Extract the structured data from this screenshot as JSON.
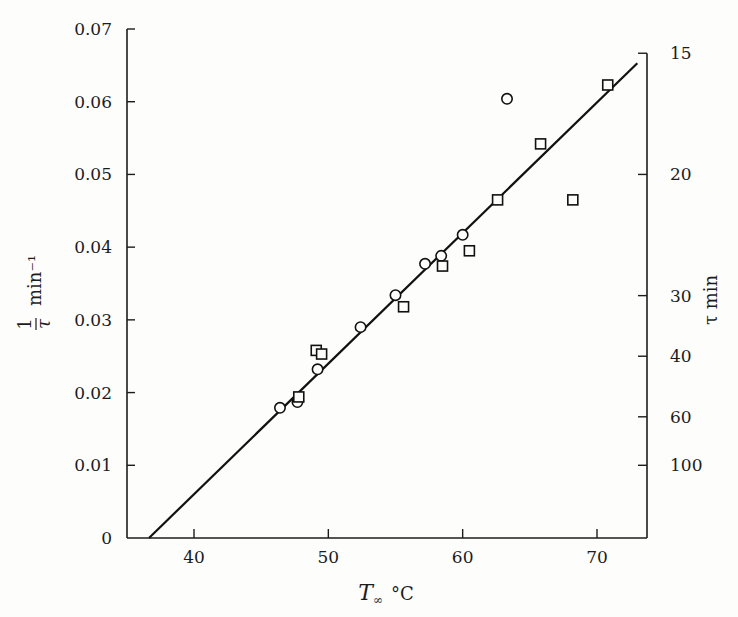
{
  "chart_data": {
    "type": "scatter",
    "title": "",
    "xlabel": "T∞ °C",
    "xlabel_main": "T",
    "xlabel_sub": "∞",
    "xlabel_unit": "°C",
    "ylabel": "1/τ min⁻¹",
    "ylabel_num": "1",
    "ylabel_den": "τ",
    "ylabel_unit": "min⁻¹",
    "y2label": "τ min",
    "xlim": [
      35.3,
      73.7
    ],
    "ylim": [
      0,
      0.07
    ],
    "grid": false,
    "legend": "none",
    "x_ticks": [
      {
        "value": 40,
        "label": "40"
      },
      {
        "value": 50,
        "label": "50"
      },
      {
        "value": 60,
        "label": "60"
      },
      {
        "value": 70,
        "label": "70"
      }
    ],
    "y_ticks": [
      {
        "value": 0,
        "label": "0"
      },
      {
        "value": 0.01,
        "label": "0.01"
      },
      {
        "value": 0.02,
        "label": "0.02"
      },
      {
        "value": 0.03,
        "label": "0.03"
      },
      {
        "value": 0.04,
        "label": "0.04"
      },
      {
        "value": 0.05,
        "label": "0.05"
      },
      {
        "value": 0.06,
        "label": "0.06"
      },
      {
        "value": 0.07,
        "label": "0.07"
      }
    ],
    "y2_ticks": [
      {
        "tau": 15,
        "label": "15"
      },
      {
        "tau": 20,
        "label": "20"
      },
      {
        "tau": 30,
        "label": "30"
      },
      {
        "tau": 40,
        "label": "40"
      },
      {
        "tau": 60,
        "label": "60"
      },
      {
        "tau": 100,
        "label": "100"
      }
    ],
    "series": [
      {
        "name": "circles",
        "marker": "circle",
        "points": [
          {
            "x": 46.4,
            "y": 0.0179
          },
          {
            "x": 47.7,
            "y": 0.0187
          },
          {
            "x": 49.2,
            "y": 0.0232
          },
          {
            "x": 52.4,
            "y": 0.029
          },
          {
            "x": 55.0,
            "y": 0.0334
          },
          {
            "x": 57.2,
            "y": 0.0377
          },
          {
            "x": 58.4,
            "y": 0.0388
          },
          {
            "x": 60.0,
            "y": 0.0417
          },
          {
            "x": 63.3,
            "y": 0.0604
          }
        ]
      },
      {
        "name": "squares",
        "marker": "square",
        "points": [
          {
            "x": 47.8,
            "y": 0.0194
          },
          {
            "x": 49.1,
            "y": 0.0258
          },
          {
            "x": 49.5,
            "y": 0.0253
          },
          {
            "x": 55.6,
            "y": 0.0318
          },
          {
            "x": 58.5,
            "y": 0.0374
          },
          {
            "x": 60.5,
            "y": 0.0395
          },
          {
            "x": 62.6,
            "y": 0.0465
          },
          {
            "x": 65.8,
            "y": 0.0542
          },
          {
            "x": 68.2,
            "y": 0.0465
          },
          {
            "x": 70.8,
            "y": 0.0623
          }
        ]
      }
    ],
    "fit_line": {
      "start": {
        "x": 36.65,
        "y": 0.0
      },
      "end": {
        "x": 73.0,
        "y": 0.0653
      }
    }
  }
}
